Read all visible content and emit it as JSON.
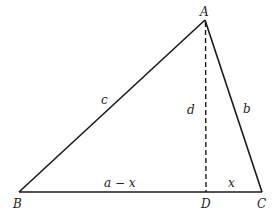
{
  "diagram": {
    "type": "triangle-with-altitude",
    "colors": {
      "stroke": "#1a1a1a",
      "background": "#ffffff"
    },
    "vertices": {
      "A": {
        "label": "A",
        "x": 205,
        "y": 20
      },
      "B": {
        "label": "B",
        "x": 19,
        "y": 192
      },
      "C": {
        "label": "C",
        "x": 262,
        "y": 192
      },
      "D": {
        "label": "D",
        "x": 206,
        "y": 192
      }
    },
    "sides": {
      "c": {
        "label": "c",
        "from": "B",
        "to": "A"
      },
      "b": {
        "label": "b",
        "from": "A",
        "to": "C"
      },
      "a": {
        "from": "B",
        "to": "C"
      }
    },
    "altitude": {
      "label": "d",
      "from": "A",
      "to": "D",
      "style": "dashed"
    },
    "segments": {
      "BD": {
        "label": "a − x"
      },
      "DC": {
        "label": "x"
      }
    }
  }
}
